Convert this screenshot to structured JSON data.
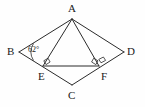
{
  "figure": {
    "background_color": "#fefefe",
    "stroke_color": "#2b2b2b",
    "text_color": "#1a1a1a",
    "vertices": [
      {
        "name": "A",
        "label": "A",
        "x": 72,
        "y": 19
      },
      {
        "name": "B",
        "label": "B",
        "x": 19,
        "y": 52
      },
      {
        "name": "C",
        "label": "C",
        "x": 72,
        "y": 85
      },
      {
        "name": "D",
        "label": "D",
        "x": 124,
        "y": 52
      },
      {
        "name": "E",
        "label": "E",
        "x": 43,
        "y": 66
      },
      {
        "name": "F",
        "label": "F",
        "x": 99,
        "y": 66
      }
    ],
    "angles": [
      {
        "at": "B",
        "label": "62°",
        "marker": "arc"
      },
      {
        "at": "E",
        "label": "",
        "marker": "right-angle"
      },
      {
        "at": "F",
        "label": "",
        "marker": "right-angle"
      },
      {
        "at": "F",
        "label": "",
        "marker": "right-angle"
      }
    ],
    "segments": [
      {
        "from": "A",
        "to": "B"
      },
      {
        "from": "B",
        "to": "C"
      },
      {
        "from": "C",
        "to": "D"
      },
      {
        "from": "D",
        "to": "A"
      },
      {
        "from": "A",
        "to": "E"
      },
      {
        "from": "A",
        "to": "F"
      },
      {
        "from": "E",
        "to": "F"
      }
    ]
  }
}
